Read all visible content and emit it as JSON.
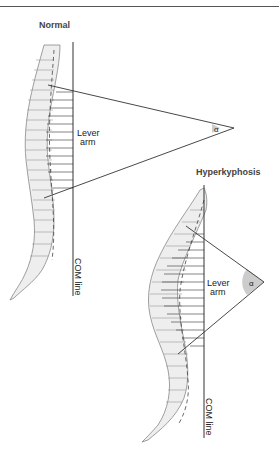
{
  "header": {
    "cropped_text": "page"
  },
  "panels": [
    {
      "id": "normal",
      "title": "Normal",
      "lever_label_line1": "Lever",
      "lever_label_line2": "arm",
      "angle_label": "α",
      "com_label": "COM line"
    },
    {
      "id": "hyperkyphosis",
      "title": "Hyperkyphosis",
      "lever_label_line1": "Lever",
      "lever_label_line2": "arm",
      "angle_label": "α",
      "com_label": "COM line"
    }
  ],
  "colors": {
    "line": "#333333",
    "spine_fill": "#eeeeee",
    "spine_stroke": "#888888",
    "angle_fill": "#cccccc",
    "text": "#222222"
  }
}
